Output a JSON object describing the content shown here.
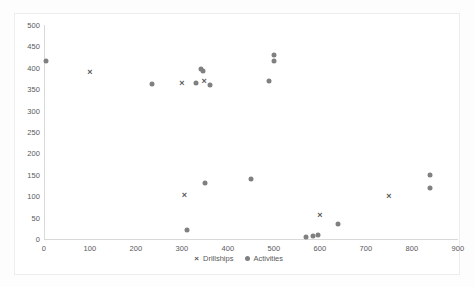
{
  "chart_data": {
    "type": "scatter",
    "title": "",
    "xlabel": "",
    "ylabel": "",
    "xlim": [
      0,
      900
    ],
    "ylim": [
      0,
      500
    ],
    "xticks": [
      0,
      100,
      200,
      300,
      400,
      500,
      600,
      700,
      800,
      900
    ],
    "yticks": [
      0,
      50,
      100,
      150,
      200,
      250,
      300,
      350,
      400,
      450,
      500
    ],
    "grid": false,
    "legend_position": "bottom",
    "series": [
      {
        "name": "Drillships",
        "marker": "cross",
        "color": "#595959",
        "points": [
          [
            100,
            390
          ],
          [
            300,
            365
          ],
          [
            348,
            368
          ],
          [
            305,
            102
          ],
          [
            600,
            55
          ],
          [
            750,
            100
          ]
        ]
      },
      {
        "name": "Activities",
        "marker": "dot",
        "color": "#808080",
        "points": [
          [
            5,
            415
          ],
          [
            235,
            362
          ],
          [
            330,
            365
          ],
          [
            342,
            398
          ],
          [
            345,
            392
          ],
          [
            360,
            360
          ],
          [
            350,
            130
          ],
          [
            310,
            22
          ],
          [
            450,
            140
          ],
          [
            490,
            368
          ],
          [
            500,
            430
          ],
          [
            500,
            415
          ],
          [
            570,
            5
          ],
          [
            585,
            8
          ],
          [
            595,
            10
          ],
          [
            640,
            35
          ],
          [
            840,
            150
          ],
          [
            840,
            120
          ]
        ]
      }
    ]
  },
  "legend": {
    "items": [
      {
        "label": "Drillships",
        "marker": "cross-marker"
      },
      {
        "label": "Activities",
        "marker": "dot-marker"
      }
    ]
  },
  "colors": {
    "drillships": "#595959",
    "activities": "#808080",
    "axis": "#d9d9d9",
    "tick_text": "#595959",
    "card_border": "#ededed",
    "background": "#ffffff"
  }
}
